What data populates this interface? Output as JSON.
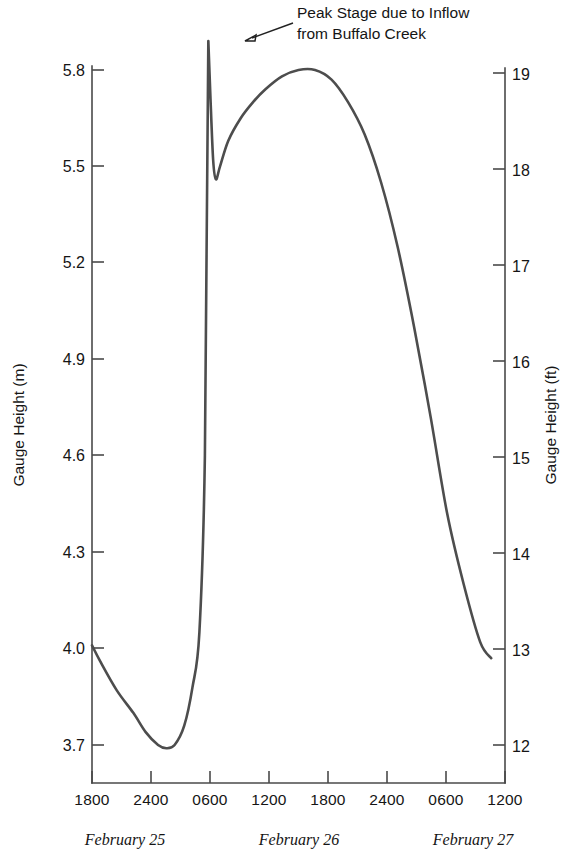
{
  "chart_data": {
    "type": "line",
    "title": "",
    "subtitle": "",
    "xlabel": "",
    "ylabel": "Gauge Height (m)",
    "y2label": "Gauge Height (ft)",
    "grid": false,
    "legend": "none",
    "x_tick_labels": [
      "1800",
      "2400",
      "0600",
      "1200",
      "1800",
      "2400",
      "0600",
      "1200"
    ],
    "x_group_labels": [
      "February 25",
      "February 26",
      "February 27"
    ],
    "y_tick_labels": [
      "5.8",
      "5.5",
      "5.2",
      "4.9",
      "4.6",
      "4.3",
      "4.0",
      "3.7"
    ],
    "y_tick_values": [
      5.8,
      5.5,
      5.2,
      4.9,
      4.6,
      4.3,
      4.0,
      3.7
    ],
    "y2_tick_labels": [
      "19",
      "18",
      "17",
      "16",
      "15",
      "14",
      "13",
      "12"
    ],
    "y2_tick_values": [
      19,
      18,
      17,
      16,
      15,
      14,
      13,
      12
    ],
    "ylim": [
      3.58,
      5.93
    ],
    "y2lim": [
      11.75,
      19.45
    ],
    "xlim": [
      1800,
      4800
    ],
    "annotations": [
      {
        "name": "peak-stage-annotation",
        "line1": "Peak Stage due to Inflow",
        "line2": "from Buffalo Creek",
        "points_to_x": 2645,
        "points_to_y": 5.89
      }
    ],
    "series": [
      {
        "name": "Gauge Height",
        "color": "#4d4d4d",
        "x": [
          1800,
          1860,
          1980,
          2100,
          2190,
          2280,
          2340,
          2400,
          2470,
          2530,
          2580,
          2620,
          2645,
          2660,
          2680,
          2700,
          2730,
          2790,
          2880,
          2970,
          3060,
          3180,
          3300,
          3420,
          3540,
          3660,
          3780,
          3900,
          4020,
          4140,
          4260,
          4380,
          4500,
          4620,
          4700
        ],
        "y": [
          4.01,
          3.96,
          3.87,
          3.8,
          3.74,
          3.7,
          3.69,
          3.7,
          3.76,
          3.88,
          4.05,
          4.6,
          5.89,
          5.72,
          5.52,
          5.46,
          5.5,
          5.58,
          5.65,
          5.7,
          5.74,
          5.78,
          5.8,
          5.8,
          5.77,
          5.7,
          5.6,
          5.45,
          5.25,
          5.0,
          4.72,
          4.42,
          4.2,
          4.02,
          3.97
        ]
      }
    ],
    "data_notes": {
      "start_value": 4.01,
      "pre_spike_min": 3.69,
      "spike_peak": 5.89,
      "post_spike_dip": 5.46,
      "broad_peak": 5.8,
      "end_value": 3.97
    }
  }
}
